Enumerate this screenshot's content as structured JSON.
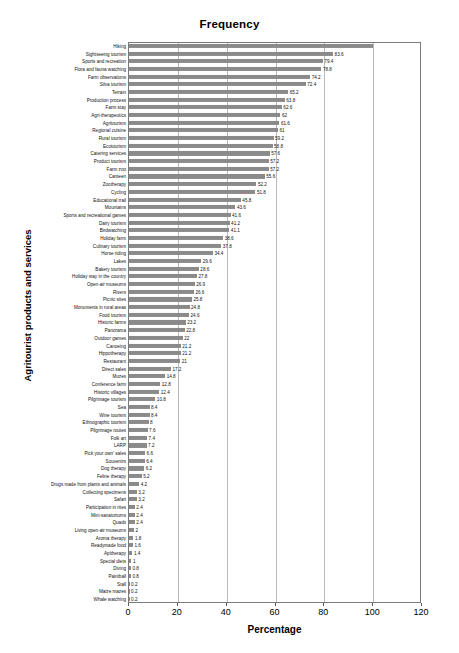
{
  "chart_data": {
    "type": "bar",
    "orientation": "horizontal",
    "title": "Frequency",
    "xlabel": "Percentage",
    "ylabel": "Agritourist products and services",
    "xlim": [
      0,
      120
    ],
    "xticks": [
      0,
      20,
      40,
      60,
      80,
      100,
      120
    ],
    "grid": true,
    "grid_axis": "x",
    "legend": null,
    "bar_color": "#8a8a8a",
    "categories": [
      "Hiking",
      "Sightseeing tourism",
      "Sports and recreation",
      "Flora and fauna watching",
      "Farm observations",
      "Silva tourism",
      "Terrain",
      "Production process",
      "Farm stay",
      "Agri-therapeutics",
      "Agritourism",
      "Regional cuisine",
      "Rural tourism",
      "Ecotourism",
      "Catering services",
      "Product tourism",
      "Farm zoo",
      "Canteen",
      "Zootherapy",
      "Cycling",
      "Educational trail",
      "Mountains",
      "Sports and recreational games",
      "Dairy tourism",
      "Birdwatching",
      "Holiday farm",
      "Culinary tourism",
      "Horse riding",
      "Lakes",
      "Bakery tourism",
      "Holiday stay in the country",
      "Open-air museums",
      "Rivers",
      "Picnic sites",
      "Monuments in rural areas",
      "Food tourism",
      "Historic farms",
      "Panorama",
      "Outdoor games",
      "Canoeing",
      "Hippotherapy",
      "Restaurant",
      "Direct sales",
      "Muzes",
      "Conference farm",
      "Historic villages",
      "Pilgrimage tourism",
      "Sea",
      "Wine tourism",
      "Ethnographic tourism",
      "Pilgrimage routes",
      "Folk art",
      "LARP",
      "Pick your own' sales",
      "Souvenirs",
      "Dog therapy",
      "Feline therapy",
      "Drugs made from plants and animals",
      "Collecting specimens",
      "Safari",
      "Participation in rites",
      "Mini-sanatoriums",
      "Quads",
      "Living open-air museums",
      "Aroma therapy",
      "Readymade food",
      "Apitherapy",
      "Special diets",
      "Diving",
      "Paintball",
      "Stall",
      "Maize mazes",
      "Whale watching"
    ],
    "values": [
      100,
      83.6,
      79.4,
      78.8,
      74.2,
      72.4,
      65.2,
      63.8,
      62.6,
      62,
      61.6,
      61,
      59.2,
      58.8,
      57.6,
      57.2,
      57.2,
      55.6,
      52.2,
      51.8,
      45.8,
      43.6,
      41.6,
      41.2,
      41.1,
      38.6,
      37.8,
      34.4,
      29.6,
      28.6,
      27.8,
      26.9,
      26.6,
      25.8,
      24.8,
      24.6,
      23.2,
      22.8,
      22,
      21.2,
      21.2,
      21,
      17.2,
      14.8,
      12.8,
      12.4,
      10.8,
      8.4,
      8.4,
      8,
      7.6,
      7.4,
      7.2,
      6.6,
      6.4,
      6.2,
      5.2,
      4.2,
      3.2,
      3.2,
      2.4,
      2.4,
      2.4,
      2,
      1.8,
      1.6,
      1.4,
      1,
      0.8,
      0.8,
      0.2,
      0.2,
      0.2
    ],
    "value_labels": [
      "",
      "83.6",
      "79.4",
      "78.8",
      "74.2",
      "72.4",
      "65.2",
      "63.8",
      "62.6",
      "62",
      "61.6",
      "61",
      "59.2",
      "58.8",
      "57.6",
      "57.2",
      "57.2",
      "55.6",
      "52.2",
      "51.8",
      "45.8",
      "43.6",
      "41.6",
      "41.2",
      "41.1",
      "38.6",
      "37.8",
      "34.4",
      "29.6",
      "28.6",
      "27.8",
      "26.9",
      "26.6",
      "25.8",
      "24.8",
      "24.6",
      "23.2",
      "22.8",
      "22",
      "21.2",
      "21.2",
      "21",
      "17.2",
      "14.8",
      "12.8",
      "12.4",
      "10.8",
      "8.4",
      "8.4",
      "8",
      "7.6",
      "7.4",
      "7.2",
      "6.6",
      "6.4",
      "6.2",
      "5.2",
      "4.2",
      "3.2",
      "3.2",
      "2.4",
      "2.4",
      "2.4",
      "2",
      "1.8",
      "1.6",
      "1.4",
      "1",
      "0.8",
      "0.8",
      "0.2",
      "0.2",
      "0.2"
    ]
  },
  "caption": ""
}
